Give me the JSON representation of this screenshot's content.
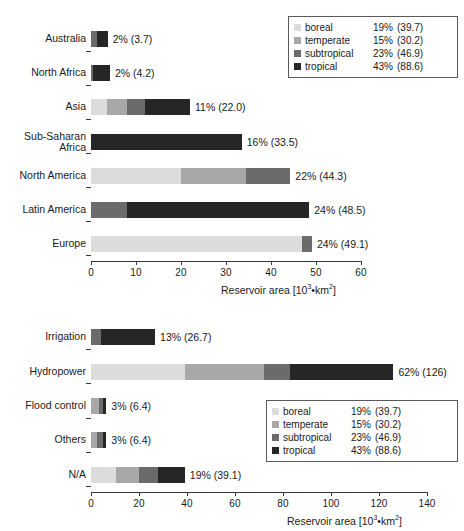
{
  "chart_data": [
    {
      "type": "bar",
      "orientation": "horizontal",
      "stacked": true,
      "title": "",
      "xlabel": "Reservoir area [10³•km²]",
      "ylabel": "",
      "xlim": [
        0,
        60
      ],
      "xticks": [
        0,
        10,
        20,
        30,
        40,
        50,
        60
      ],
      "grid": "vertical",
      "legend_position": "top-right",
      "categories": [
        "Australia",
        "North Africa",
        "Asia",
        "Sub-Saharan\nAfrica",
        "North America",
        "Latin America",
        "Europe"
      ],
      "series": [
        {
          "name": "boreal",
          "values": [
            0.0,
            0.0,
            3.5,
            0.0,
            20.0,
            0.0,
            46.9
          ]
        },
        {
          "name": "temperate",
          "values": [
            0.0,
            0.0,
            4.6,
            0.0,
            14.5,
            0.0,
            0.0
          ]
        },
        {
          "name": "subtropical",
          "values": [
            1.4,
            0.4,
            4.0,
            0.0,
            9.8,
            8.0,
            2.2
          ]
        },
        {
          "name": "tropical",
          "values": [
            2.3,
            3.8,
            9.9,
            33.5,
            0.0,
            40.5,
            0.0
          ]
        }
      ],
      "labels": [
        "2% (3.7)",
        "2% (4.2)",
        "11% (22.0)",
        "16% (33.5)",
        "22% (44.3)",
        "24% (48.5)",
        "24% (49.1)"
      ],
      "totals": [
        3.7,
        4.2,
        22.0,
        33.5,
        44.3,
        48.5,
        49.1
      ]
    },
    {
      "type": "bar",
      "orientation": "horizontal",
      "stacked": true,
      "title": "",
      "xlabel": "Reservoir area [10³•km²]",
      "ylabel": "",
      "xlim": [
        0,
        140
      ],
      "xticks": [
        0,
        20,
        40,
        60,
        80,
        100,
        120,
        140
      ],
      "grid": "vertical",
      "legend_position": "bottom-right",
      "categories": [
        "Irrigation",
        "Hydropower",
        "Flood control",
        "Others",
        "N/A"
      ],
      "series": [
        {
          "name": "boreal",
          "values": [
            0.0,
            39.0,
            0.0,
            0.0,
            10.5
          ]
        },
        {
          "name": "temperate",
          "values": [
            0.0,
            33.0,
            3.2,
            2.6,
            9.5
          ]
        },
        {
          "name": "subtropical",
          "values": [
            4.2,
            11.0,
            1.8,
            2.4,
            8.0
          ]
        },
        {
          "name": "tropical",
          "values": [
            22.5,
            43.0,
            1.4,
            1.4,
            11.1
          ]
        }
      ],
      "labels": [
        "13% (26.7)",
        "62% (126)",
        "3% (6.4)",
        "3% (6.4)",
        "19% (39.1)"
      ],
      "totals": [
        26.7,
        126.0,
        6.4,
        6.4,
        39.1
      ]
    }
  ],
  "legend": {
    "rows": [
      {
        "name": "boreal",
        "pct": "19%",
        "val": "(39.7)",
        "color": "#dcdcdc"
      },
      {
        "name": "temperate",
        "pct": "15%",
        "val": "(30.2)",
        "color": "#a8a8a8"
      },
      {
        "name": "subtropical",
        "pct": "23%",
        "val": "(46.9)",
        "color": "#6b6b6b"
      },
      {
        "name": "tropical",
        "pct": "43%",
        "val": "(88.6)",
        "color": "#262626"
      }
    ]
  },
  "colors": {
    "boreal": "#dcdcdc",
    "temperate": "#a8a8a8",
    "subtropical": "#6b6b6b",
    "tropical": "#262626",
    "axis": "#3a3a3a",
    "grid": "#6f6f6f",
    "text": "#1a1a1a"
  },
  "axis_title_text": {
    "prefix": "Reservoir area [10",
    "sup": "3",
    "suffix": "•km",
    "sup2": "2",
    "end": "]"
  }
}
